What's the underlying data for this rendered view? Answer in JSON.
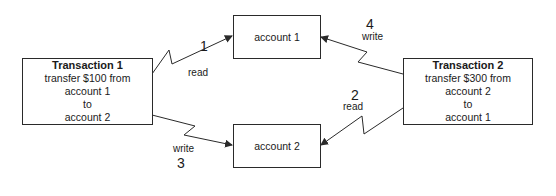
{
  "transactions": [
    {
      "title": "Transaction 1",
      "lines": [
        "transfer $100 from",
        "account 1",
        "to",
        "account 2"
      ]
    },
    {
      "title": "Transaction 2",
      "lines": [
        "transfer $300 from",
        "account 2",
        "to",
        "account 1"
      ]
    }
  ],
  "accounts": [
    {
      "label": "account 1"
    },
    {
      "label": "account 2"
    }
  ],
  "edges": [
    {
      "step": "1",
      "op": "read",
      "from": "Transaction 1",
      "to": "account 1"
    },
    {
      "step": "2",
      "op": "read",
      "from": "Transaction 2",
      "to": "account 2"
    },
    {
      "step": "3",
      "op": "write",
      "from": "Transaction 1",
      "to": "account 2"
    },
    {
      "step": "4",
      "op": "write",
      "from": "Transaction 2",
      "to": "account 1"
    }
  ],
  "colors": {
    "line": "#2a2a2a",
    "background": "#ffffff"
  }
}
